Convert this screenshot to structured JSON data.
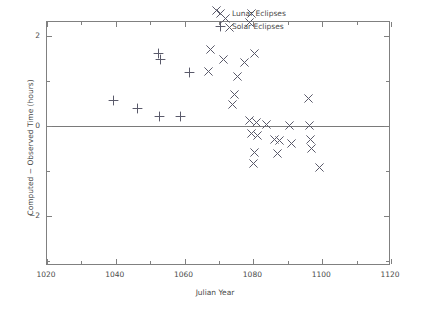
{
  "chart_data": {
    "type": "scatter",
    "title": "",
    "xlabel": "Julian Year",
    "ylabel": "Computed − Observed Time (hours)",
    "xlim": [
      1020,
      1120
    ],
    "ylim": [
      -3.11,
      2.31
    ],
    "xticks": [
      1020,
      1040,
      1060,
      1080,
      1100,
      1120
    ],
    "xticklabels": [
      "1020",
      "1040",
      "1060",
      "1080",
      "1100",
      "1120"
    ],
    "xminorticks": [
      1030,
      1050,
      1070,
      1090,
      1110
    ],
    "yticks": [
      2,
      0,
      -2
    ],
    "yticklabels": [
      "2",
      "0",
      "−2"
    ],
    "yminorticks": [
      1,
      -1,
      -3
    ],
    "grid": false,
    "legend_position": "upper right",
    "zero_reference_line": true,
    "series": [
      {
        "name": "Lunar Eclipses",
        "marker": "x",
        "color": "#5a5a6a",
        "points": [
          [
            1069.2,
            2.56
          ],
          [
            1072.0,
            2.38
          ],
          [
            1073.0,
            2.18
          ],
          [
            1079.5,
            2.49
          ],
          [
            1079.0,
            2.29
          ],
          [
            1067.5,
            1.71
          ],
          [
            1080.4,
            1.62
          ],
          [
            1071.2,
            1.47
          ],
          [
            1077.5,
            1.42
          ],
          [
            1067.0,
            1.22
          ],
          [
            1075.5,
            1.09
          ],
          [
            1074.5,
            0.71
          ],
          [
            1074.0,
            0.47
          ],
          [
            1096.0,
            0.62
          ],
          [
            1078.8,
            0.13
          ],
          [
            1081.0,
            0.07
          ],
          [
            1083.7,
            0.04
          ],
          [
            1090.6,
            0.02
          ],
          [
            1096.2,
            0.0
          ],
          [
            1079.5,
            -0.16
          ],
          [
            1081.1,
            -0.22
          ],
          [
            1086.0,
            -0.31
          ],
          [
            1087.5,
            -0.33
          ],
          [
            1091.0,
            -0.38
          ],
          [
            1096.5,
            -0.29
          ],
          [
            1096.8,
            -0.49
          ],
          [
            1080.2,
            -0.58
          ],
          [
            1080.0,
            -0.84
          ],
          [
            1087.0,
            -0.62
          ],
          [
            1099.3,
            -0.93
          ]
        ]
      },
      {
        "name": "Solar Eclipses",
        "marker": "+",
        "points": [
          [
            1052.3,
            1.62
          ],
          [
            1053.1,
            1.47
          ],
          [
            1061.5,
            1.18
          ],
          [
            1039.4,
            0.56
          ],
          [
            1046.2,
            0.38
          ],
          [
            1052.6,
            0.22
          ],
          [
            1058.8,
            0.2
          ]
        ]
      }
    ]
  }
}
